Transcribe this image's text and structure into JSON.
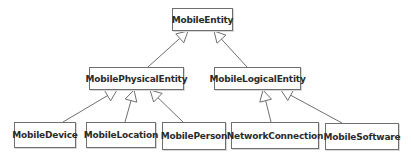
{
  "diagram": {
    "type": "class-inheritance-hierarchy",
    "colors": {
      "line": "#6f6f6f",
      "box_border": "#6f6f6f",
      "text": "#2b2b2b",
      "background": "#ffffff"
    },
    "nodes": [
      {
        "id": "MobileEntity",
        "label": "MobileEntity",
        "x": 172,
        "y": 8,
        "w": 61,
        "h": 23
      },
      {
        "id": "MobilePhysicalEntity",
        "label": "MobilePhysicalEntity",
        "x": 89,
        "y": 67,
        "w": 95,
        "h": 23
      },
      {
        "id": "MobileLogicalEntity",
        "label": "MobileLogicalEntity",
        "x": 214,
        "y": 67,
        "w": 87,
        "h": 23
      },
      {
        "id": "MobileDevice",
        "label": "MobileDevice",
        "x": 14,
        "y": 122,
        "w": 62,
        "h": 26
      },
      {
        "id": "MobileLocation",
        "label": "MobileLocation",
        "x": 86,
        "y": 122,
        "w": 70,
        "h": 26
      },
      {
        "id": "MobilePerson",
        "label": "MobilePerson",
        "x": 162,
        "y": 122,
        "w": 64,
        "h": 28
      },
      {
        "id": "NetworkConnection",
        "label": "NetworkConnection",
        "x": 231,
        "y": 122,
        "w": 88,
        "h": 27
      },
      {
        "id": "MobileSoftware",
        "label": "MobileSoftware",
        "x": 325,
        "y": 123,
        "w": 74,
        "h": 27
      }
    ],
    "edges": [
      {
        "from": "MobilePhysicalEntity",
        "to": "MobileEntity",
        "kind": "generalization",
        "x1": 148,
        "y1": 67,
        "x2": 188,
        "y2": 31
      },
      {
        "from": "MobileLogicalEntity",
        "to": "MobileEntity",
        "kind": "generalization",
        "x1": 247,
        "y1": 67,
        "x2": 214,
        "y2": 31
      },
      {
        "from": "MobileDevice",
        "to": "MobilePhysicalEntity",
        "kind": "generalization",
        "x1": 63,
        "y1": 122,
        "x2": 117,
        "y2": 90
      },
      {
        "from": "MobileLocation",
        "to": "MobilePhysicalEntity",
        "kind": "generalization",
        "x1": 125,
        "y1": 122,
        "x2": 134,
        "y2": 90
      },
      {
        "from": "MobilePerson",
        "to": "MobilePhysicalEntity",
        "kind": "generalization",
        "x1": 183,
        "y1": 122,
        "x2": 150,
        "y2": 90
      },
      {
        "from": "NetworkConnection",
        "to": "MobileLogicalEntity",
        "kind": "generalization",
        "x1": 271,
        "y1": 122,
        "x2": 263,
        "y2": 90
      },
      {
        "from": "MobileSoftware",
        "to": "MobileLogicalEntity",
        "kind": "generalization",
        "x1": 342,
        "y1": 123,
        "x2": 281,
        "y2": 90
      }
    ]
  }
}
